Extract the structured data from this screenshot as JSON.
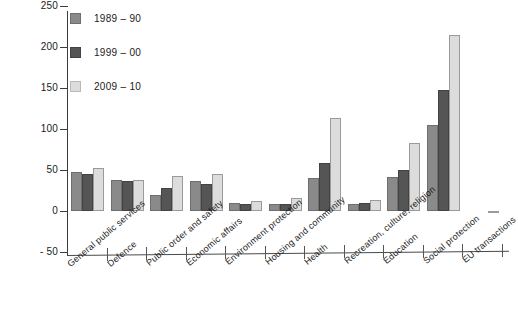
{
  "chart_data": {
    "type": "bar",
    "title": "",
    "xlabel": "",
    "ylabel": "",
    "ylim": [
      -50,
      250
    ],
    "yticks": [
      "250",
      "200",
      "150",
      "100",
      "50",
      "0",
      "- 50"
    ],
    "ytick_values": [
      250,
      200,
      150,
      100,
      50,
      0,
      -50
    ],
    "grid": false,
    "legend_position": "top-left",
    "categories": [
      "General public services",
      "Defence",
      "Public order and safety",
      "Economic affairs",
      "Environment protection",
      "Housing and community",
      "Health",
      "Recreation, culture, religion",
      "Education",
      "Social protection",
      "EU transactions"
    ],
    "series": [
      {
        "name": "1989 – 90",
        "color": "#8a8a8a",
        "values": [
          48,
          38,
          20,
          37,
          10,
          9,
          40,
          8,
          42,
          105,
          0
        ]
      },
      {
        "name": "1999 – 00",
        "color": "#555555",
        "values": [
          45,
          36,
          28,
          33,
          9,
          8,
          58,
          10,
          50,
          148,
          0
        ]
      },
      {
        "name": "2009 – 10",
        "color": "#dcdcdc",
        "values": [
          52,
          38,
          43,
          45,
          12,
          16,
          114,
          14,
          83,
          215,
          -3
        ]
      }
    ]
  },
  "legend": {
    "entries": [
      {
        "label": "1989 – 90",
        "color": "#8a8a8a"
      },
      {
        "label": "1999 – 00",
        "color": "#555555"
      },
      {
        "label": "2009 – 10",
        "color": "#dcdcdc"
      }
    ]
  },
  "colors": {
    "series_1989_90": "#8a8a8a",
    "series_1999_00": "#555555",
    "series_2009_10": "#dcdcdc",
    "axis": "#3c3c3c",
    "background": "#ffffff"
  }
}
